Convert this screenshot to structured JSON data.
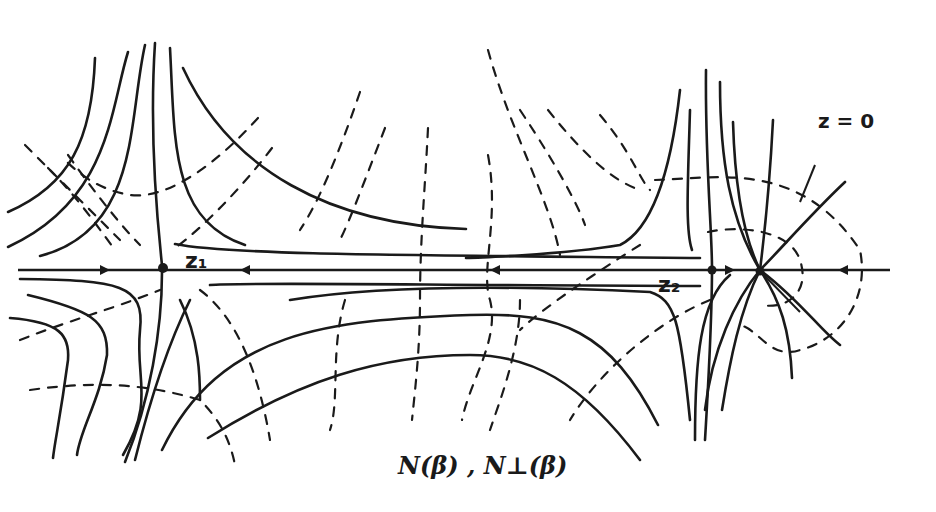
{
  "diagram": {
    "type": "hand-drawn flow field / trajectory diagram",
    "caption": "N(β) , N⊥(β)",
    "caption_parts": {
      "left": "N(β)",
      "separator": ",",
      "right": "N⊥(β)"
    },
    "points": [
      {
        "id": "z1",
        "label": "z₁",
        "x": 163,
        "y": 268
      },
      {
        "id": "z2",
        "label": "z₂",
        "x": 712,
        "y": 270
      },
      {
        "id": "z0",
        "label": "z = 0",
        "x": 760,
        "y": 271
      }
    ],
    "legend": {
      "solid_lines": "N(β) trajectories",
      "dashed_lines": "N⊥(β) orthogonal trajectories"
    },
    "axis": {
      "y": 270,
      "x_start": 18,
      "x_end": 890
    },
    "colors": {
      "ink": "#1a1a1a",
      "paper": "#ffffff"
    }
  }
}
